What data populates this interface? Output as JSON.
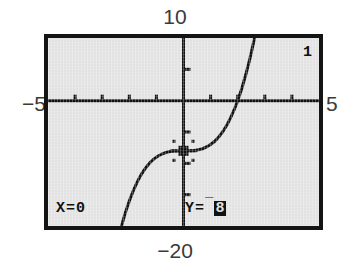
{
  "device": {
    "kind": "graphing-calculator-screen",
    "mode": "trace"
  },
  "window_labels": {
    "ymax": "10",
    "ymin": "−20",
    "xmin": "−5",
    "xmax": "5"
  },
  "readout": {
    "x_label": "X=0",
    "y_prefix": "Y=",
    "y_negative_sign": "¯",
    "y_value": "8",
    "y_full": "Y= -8"
  },
  "equation_index": "1",
  "colors": {
    "screen_background": "#e2e2e2",
    "bezel": "#141414",
    "ink": "#111111",
    "page_background": "#ffffff",
    "label_text": "#3a3a3a"
  },
  "chart_data": {
    "type": "line",
    "title": "",
    "subtitle": "",
    "xlabel": "",
    "ylabel": "",
    "xlim": [
      -5,
      5
    ],
    "ylim": [
      -20,
      10
    ],
    "grid": false,
    "legend": null,
    "axes": {
      "x_axis_at_y": 0,
      "y_axis_at_x": 0,
      "xscl": 1,
      "yscl": 5,
      "x_ticks": [
        -4,
        -3,
        -2,
        -1,
        1,
        2,
        3,
        4
      ],
      "y_ticks": [
        -15,
        -10,
        -5,
        5
      ]
    },
    "annotations": [
      {
        "name": "trace-cursor",
        "shape": "cross",
        "x": 0,
        "y": -8,
        "label": "X=0  Y=-8"
      }
    ],
    "series": [
      {
        "name": "Y1",
        "expression": "y = x^3 - 8",
        "x": [
          -2.6,
          -2.45,
          -2.3,
          -2.15,
          -2.0,
          -1.85,
          -1.7,
          -1.55,
          -1.4,
          -1.25,
          -1.1,
          -0.95,
          -0.8,
          -0.65,
          -0.5,
          -0.35,
          -0.2,
          -0.05,
          0.0,
          0.1,
          0.25,
          0.4,
          0.55,
          0.7,
          0.85,
          1.0,
          1.15,
          1.3,
          1.45,
          1.6,
          1.75,
          1.9,
          2.0,
          2.15,
          2.3,
          2.45,
          2.6,
          2.75,
          2.9,
          3.0
        ],
        "y": [
          -25.58,
          -22.71,
          -20.17,
          -17.94,
          -16.0,
          -14.33,
          -12.91,
          -11.72,
          -10.74,
          -9.95,
          -9.33,
          -8.86,
          -8.51,
          -8.27,
          -8.13,
          -8.04,
          -8.01,
          -8.0,
          -8.0,
          -8.0,
          -7.98,
          -7.94,
          -7.83,
          -7.66,
          -7.39,
          -7.0,
          -6.48,
          -5.8,
          -4.95,
          -3.9,
          -2.64,
          -1.14,
          0.0,
          1.94,
          4.17,
          6.71,
          9.58,
          12.8,
          16.39,
          19.0
        ]
      }
    ]
  }
}
